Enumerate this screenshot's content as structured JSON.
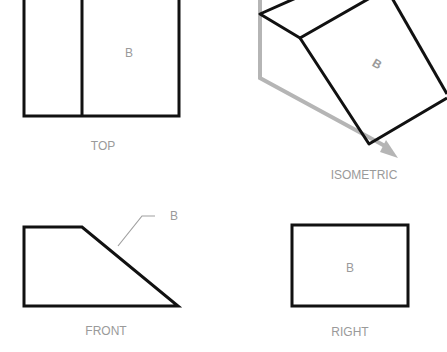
{
  "views": {
    "top": {
      "caption": "TOP",
      "face_label": "B"
    },
    "isometric": {
      "caption": "ISOMETRIC",
      "face_label": "B"
    },
    "front": {
      "caption": "FRONT",
      "leader_label": "B"
    },
    "right": {
      "caption": "RIGHT",
      "face_label": "B"
    }
  },
  "colors": {
    "outline": "#111111",
    "axis": "#b3b3b3",
    "label": "#9a9a9a",
    "leader": "#a0a0a0"
  }
}
